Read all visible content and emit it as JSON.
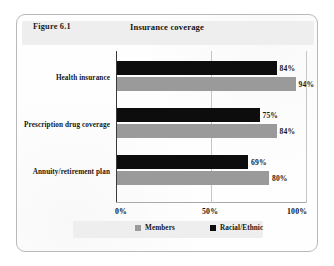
{
  "figure": {
    "number_label": "Figure 6.1",
    "title": "Insurance coverage"
  },
  "legend": {
    "entries": [
      {
        "label": "Members",
        "swatch": "gray",
        "color": "#9a9a9a"
      },
      {
        "label": "Racial/Ethnic",
        "swatch": "dark",
        "color": "#0d0d0d"
      }
    ]
  },
  "axis": {
    "ticks": [
      "0%",
      "50%",
      "100%"
    ],
    "tick_values": [
      0,
      50,
      100
    ]
  },
  "chart_data": {
    "type": "bar",
    "orientation": "horizontal",
    "title": "Insurance coverage",
    "xlabel": "",
    "ylabel": "",
    "xlim": [
      0,
      100
    ],
    "grid": true,
    "gridlines": [
      0,
      50,
      100
    ],
    "legend_position": "bottom",
    "categories": [
      "Health insurance",
      "Prescription drug coverage",
      "Annuity/retirement plan"
    ],
    "series": [
      {
        "name": "Racial/Ethnic",
        "color": "#0d0d0d",
        "values": [
          84,
          75,
          69
        ],
        "value_labels": [
          "84%",
          "75%",
          "69%"
        ]
      },
      {
        "name": "Members",
        "color": "#9a9a9a",
        "values": [
          94,
          84,
          80
        ],
        "value_labels": [
          "94%",
          "84%",
          "80%"
        ]
      }
    ]
  }
}
